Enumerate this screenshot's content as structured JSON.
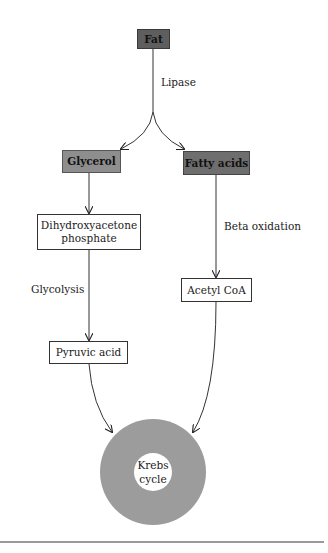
{
  "diagram": {
    "nodes": {
      "fat": "Fat",
      "glycerol": "Glycerol",
      "fatty_acids": "Fatty acids",
      "dihydroxyacetone": "Dihydroxyacetone phosphate",
      "dihydroxyacetone_line1": "Dihydroxyacetone",
      "dihydroxyacetone_line2": "phosphate",
      "acetyl_coa": "Acetyl CoA",
      "pyruvic_acid": "Pyruvic acid",
      "krebs_line1": "Krebs",
      "krebs_line2": "cycle"
    },
    "edge_labels": {
      "lipase": "Lipase",
      "glycolysis": "Glycolysis",
      "beta_oxidation": "Beta oxidation"
    },
    "colors": {
      "fat_fill": "#5e5e5e",
      "glycerol_fill": "#8e8e8e",
      "fatty_acids_fill": "#6e6e6e",
      "krebs_ring": "#9c9c9c"
    }
  }
}
